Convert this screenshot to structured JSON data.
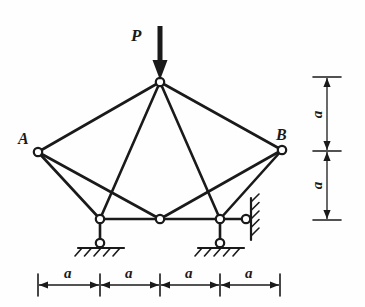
{
  "figure": {
    "type": "structural-truss-diagram",
    "title": "",
    "ink_color": "#1a1a1a",
    "background": "#fefefe"
  },
  "labels": {
    "load": "P",
    "node_a": "A",
    "node_b": "B",
    "dim": "a"
  },
  "load": {
    "symbol": "P",
    "direction": "down",
    "applied_at": "apex",
    "arrow": {
      "x": 160,
      "y_tail": 26,
      "y_head": 80,
      "shaft_width": 5,
      "head_width": 15,
      "head_length": 20
    }
  },
  "nodes": [
    {
      "id": "apex",
      "name": "apex-node",
      "x": 160,
      "y": 82,
      "label": "",
      "r": 4.2
    },
    {
      "id": "A",
      "name": "node-a",
      "x": 38,
      "y": 152,
      "label": "A",
      "r": 4.2
    },
    {
      "id": "B",
      "name": "node-b",
      "x": 282,
      "y": 150,
      "label": "B",
      "r": 4.2
    },
    {
      "id": "bl",
      "name": "bottom-left-node",
      "x": 100,
      "y": 219,
      "label": "",
      "r": 4.2
    },
    {
      "id": "bm",
      "name": "bottom-mid-node",
      "x": 160,
      "y": 219,
      "label": "",
      "r": 4.2
    },
    {
      "id": "br",
      "name": "bottom-right-node",
      "x": 220,
      "y": 219,
      "label": "",
      "r": 4.2
    }
  ],
  "members": [
    {
      "name": "member-apex-a",
      "x1": 160,
      "y1": 82,
      "x2": 38,
      "y2": 152
    },
    {
      "name": "member-apex-b",
      "x1": 160,
      "y1": 82,
      "x2": 282,
      "y2": 150
    },
    {
      "name": "member-apex-bl",
      "x1": 160,
      "y1": 82,
      "x2": 100,
      "y2": 219
    },
    {
      "name": "member-apex-br",
      "x1": 160,
      "y1": 82,
      "x2": 220,
      "y2": 219
    },
    {
      "name": "member-a-bl",
      "x1": 38,
      "y1": 152,
      "x2": 100,
      "y2": 219
    },
    {
      "name": "member-a-bm",
      "x1": 38,
      "y1": 152,
      "x2": 160,
      "y2": 219
    },
    {
      "name": "member-b-br",
      "x1": 282,
      "y1": 150,
      "x2": 220,
      "y2": 219
    },
    {
      "name": "member-b-bm",
      "x1": 282,
      "y1": 150,
      "x2": 160,
      "y2": 219
    },
    {
      "name": "member-bottom-chord",
      "x1": 100,
      "y1": 219,
      "x2": 220,
      "y2": 219
    }
  ],
  "supports": [
    {
      "name": "support-left-pin",
      "kind": "link-to-ground-pin",
      "link": {
        "x1": 100,
        "y1": 219,
        "x2": 100,
        "y2": 240
      },
      "pin": {
        "x": 100,
        "y": 243,
        "r": 4.2
      },
      "ground_line": {
        "x1": 78,
        "y1": 248,
        "x2": 124,
        "y2": 248
      },
      "hatch_count": 5,
      "hatch_angle": "down-left"
    },
    {
      "name": "support-right-pin",
      "kind": "link-to-ground-pin",
      "link": {
        "x1": 220,
        "y1": 219,
        "x2": 220,
        "y2": 240
      },
      "pin": {
        "x": 220,
        "y": 243,
        "r": 4.2
      },
      "ground_line": {
        "x1": 198,
        "y1": 248,
        "x2": 244,
        "y2": 248
      },
      "hatch_count": 5,
      "hatch_angle": "down-left"
    },
    {
      "name": "support-right-wall-link",
      "kind": "horizontal-link-to-wall",
      "link": {
        "x1": 220,
        "y1": 219,
        "x2": 243,
        "y2": 219
      },
      "pin": {
        "x": 246,
        "y": 219,
        "r": 4.2
      },
      "wall_line": {
        "x1": 251,
        "y1": 198,
        "x2": 251,
        "y2": 240
      },
      "hatch_count": 5,
      "hatch_angle": "up-right"
    }
  ],
  "dimensions": {
    "vertical": {
      "name": "vertical-dimension-stack",
      "axis_x": 327,
      "ticks": [
        {
          "y": 77,
          "x1": 313,
          "x2": 341
        },
        {
          "y": 151,
          "x1": 313,
          "x2": 341
        },
        {
          "y": 220,
          "x1": 313,
          "x2": 341
        }
      ],
      "segments": [
        {
          "name": "vdim-upper",
          "label": "a",
          "y1": 77,
          "y2": 151,
          "label_x": 314,
          "label_y": 107
        },
        {
          "name": "vdim-lower",
          "label": "a",
          "y1": 151,
          "y2": 220,
          "label_x": 314,
          "label_y": 178
        }
      ]
    },
    "horizontal": {
      "name": "horizontal-dimension-row",
      "axis_y": 285,
      "ticks": [
        {
          "x": 38,
          "y1": 274,
          "y2": 296
        },
        {
          "x": 100,
          "y1": 274,
          "y2": 296
        },
        {
          "x": 160,
          "y1": 274,
          "y2": 296
        },
        {
          "x": 220,
          "y1": 274,
          "y2": 296
        },
        {
          "x": 280,
          "y1": 274,
          "y2": 296
        }
      ],
      "segments": [
        {
          "name": "hdim-1",
          "label": "a",
          "x1": 38,
          "x2": 100,
          "label_x": 64,
          "label_y": 266
        },
        {
          "name": "hdim-2",
          "label": "a",
          "x1": 100,
          "x2": 160,
          "label_x": 125,
          "label_y": 266
        },
        {
          "name": "hdim-3",
          "label": "a",
          "x1": 160,
          "x2": 220,
          "label_x": 185,
          "label_y": 266
        },
        {
          "name": "hdim-4",
          "label": "a",
          "x1": 220,
          "x2": 280,
          "label_x": 245,
          "label_y": 266
        }
      ]
    }
  },
  "label_positions": {
    "load": {
      "x": 131,
      "y": 27
    },
    "node_a": {
      "x": 18,
      "y": 131
    },
    "node_b": {
      "x": 276,
      "y": 127
    }
  }
}
